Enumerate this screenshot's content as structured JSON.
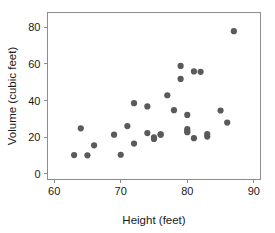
{
  "chart_data": {
    "type": "scatter",
    "title": "",
    "subtitle": "",
    "xlabel": "Height (feet)",
    "ylabel": "Volume (cubic feet)",
    "xlim": [
      59,
      91
    ],
    "ylim": [
      -3,
      88
    ],
    "xticks": [
      60,
      70,
      80,
      90
    ],
    "yticks": [
      0,
      20,
      40,
      60,
      80
    ],
    "xtick_labels": [
      "60",
      "70",
      "80",
      "90"
    ],
    "ytick_labels": [
      "0",
      "20",
      "40",
      "60",
      "80"
    ],
    "grid": false,
    "legend": null,
    "legend_position": "none",
    "marker": "circle",
    "marker_color": "#5a5a5a",
    "marker_size": 3.1,
    "frame_color": "#8d8d8d",
    "background": "#ffffff",
    "n_points": 31,
    "series": [
      {
        "name": "Black cherry trees",
        "x": [
          63,
          64,
          65,
          66,
          69,
          70,
          71,
          72,
          72,
          74,
          74,
          75,
          75,
          76,
          76,
          77,
          78,
          79,
          79,
          80,
          80,
          80,
          80,
          81,
          81,
          82,
          83,
          83,
          85,
          86,
          87
        ],
        "y": [
          10.3,
          24.9,
          10.2,
          15.6,
          21.4,
          10.5,
          26.1,
          38.6,
          16.6,
          22.3,
          36.8,
          19.1,
          19.9,
          21.6,
          21.4,
          42.9,
          34.8,
          58.9,
          51.8,
          24.5,
          32.2,
          23.4,
          22.8,
          55.9,
          19.5,
          55.7,
          20.4,
          21.8,
          34.6,
          28.0,
          77.8
        ]
      }
    ],
    "points": [
      {
        "x": 63,
        "y": 10.3
      },
      {
        "x": 64,
        "y": 24.9
      },
      {
        "x": 65,
        "y": 10.2
      },
      {
        "x": 66,
        "y": 15.6
      },
      {
        "x": 69,
        "y": 21.4
      },
      {
        "x": 70,
        "y": 10.5
      },
      {
        "x": 71,
        "y": 26.1
      },
      {
        "x": 72,
        "y": 38.6
      },
      {
        "x": 72,
        "y": 16.6
      },
      {
        "x": 74,
        "y": 22.3
      },
      {
        "x": 74,
        "y": 36.8
      },
      {
        "x": 75,
        "y": 19.1
      },
      {
        "x": 75,
        "y": 19.9
      },
      {
        "x": 76,
        "y": 21.6
      },
      {
        "x": 76,
        "y": 21.4
      },
      {
        "x": 77,
        "y": 42.9
      },
      {
        "x": 78,
        "y": 34.8
      },
      {
        "x": 79,
        "y": 58.9
      },
      {
        "x": 79,
        "y": 51.8
      },
      {
        "x": 80,
        "y": 24.5
      },
      {
        "x": 80,
        "y": 32.2
      },
      {
        "x": 80,
        "y": 23.4
      },
      {
        "x": 80,
        "y": 22.8
      },
      {
        "x": 81,
        "y": 55.9
      },
      {
        "x": 81,
        "y": 19.5
      },
      {
        "x": 82,
        "y": 55.7
      },
      {
        "x": 83,
        "y": 20.4
      },
      {
        "x": 83,
        "y": 21.8
      },
      {
        "x": 85,
        "y": 34.6
      },
      {
        "x": 86,
        "y": 28.0
      },
      {
        "x": 87,
        "y": 77.8
      }
    ]
  }
}
